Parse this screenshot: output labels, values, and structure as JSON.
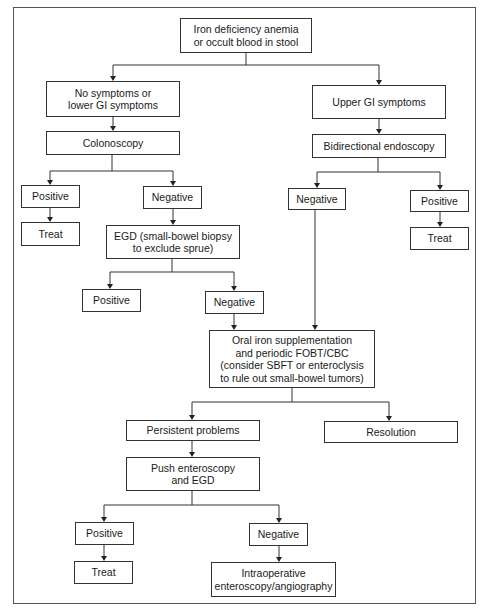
{
  "diagram": {
    "type": "flowchart",
    "nodes": {
      "start": "Iron deficiency anemia\nor occult blood in stool",
      "lower_gi": "No symptoms or\nlower GI symptoms",
      "upper_gi": "Upper GI symptoms",
      "colonoscopy": "Colonoscopy",
      "bidirectional": "Bidirectional endoscopy",
      "colon_positive": "Positive",
      "colon_negative": "Negative",
      "bidir_negative": "Negative",
      "bidir_positive": "Positive",
      "colon_treat": "Treat",
      "egd": "EGD (small-bowel biopsy\nto exclude sprue)",
      "bidir_treat": "Treat",
      "egd_positive": "Positive",
      "egd_negative": "Negative",
      "oral_iron": "Oral iron supplementation\nand periodic FOBT/CBC\n(consider SBFT or enteroclysis\nto rule out small-bowel tumors)",
      "persistent": "Persistent problems",
      "resolution": "Resolution",
      "push_enteroscopy": "Push enteroscopy\nand EGD",
      "push_positive": "Positive",
      "push_negative": "Negative",
      "push_treat": "Treat",
      "intraoperative": "Intraoperative\nenteroscopy/angiography"
    },
    "edges": [
      [
        "start",
        "lower_gi"
      ],
      [
        "start",
        "upper_gi"
      ],
      [
        "lower_gi",
        "colonoscopy"
      ],
      [
        "upper_gi",
        "bidirectional"
      ],
      [
        "colonoscopy",
        "colon_positive"
      ],
      [
        "colonoscopy",
        "colon_negative"
      ],
      [
        "bidirectional",
        "bidir_negative"
      ],
      [
        "bidirectional",
        "bidir_positive"
      ],
      [
        "colon_positive",
        "colon_treat"
      ],
      [
        "colon_negative",
        "egd"
      ],
      [
        "bidir_positive",
        "bidir_treat"
      ],
      [
        "egd",
        "egd_positive"
      ],
      [
        "egd",
        "egd_negative"
      ],
      [
        "egd_negative",
        "oral_iron"
      ],
      [
        "bidir_negative",
        "oral_iron"
      ],
      [
        "oral_iron",
        "persistent"
      ],
      [
        "oral_iron",
        "resolution"
      ],
      [
        "persistent",
        "push_enteroscopy"
      ],
      [
        "push_enteroscopy",
        "push_positive"
      ],
      [
        "push_enteroscopy",
        "push_negative"
      ],
      [
        "push_positive",
        "push_treat"
      ],
      [
        "push_negative",
        "intraoperative"
      ]
    ]
  }
}
